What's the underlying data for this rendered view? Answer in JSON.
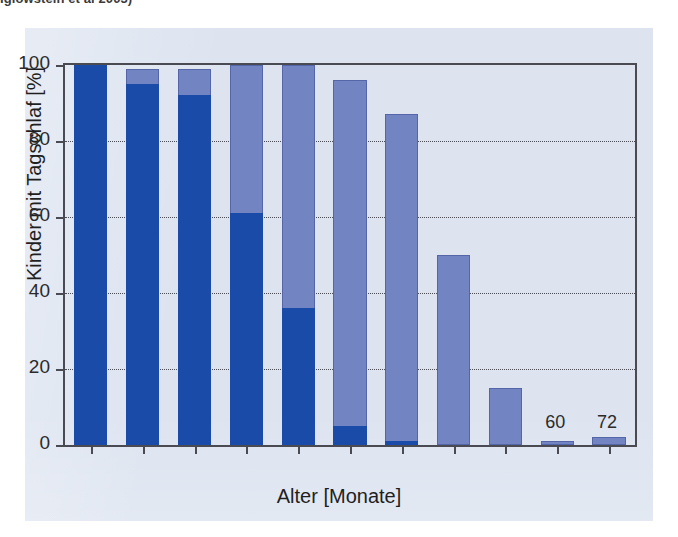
{
  "caption": {
    "text": "Iglowstein et al 2003)"
  },
  "chart_data": {
    "type": "bar",
    "stacked": true,
    "title": "",
    "xlabel": "Alter [Monate]",
    "ylabel": "Kinder mit Tagschlaf [%]",
    "categories": [
      "1",
      "3",
      "6",
      "9",
      "12",
      "18",
      "24",
      "36",
      "48",
      "60",
      "72"
    ],
    "ylim": [
      0,
      100
    ],
    "yticks": [
      0,
      20,
      40,
      60,
      80,
      100
    ],
    "ytick_labels": [
      "0",
      "20",
      "40",
      "60",
      "80",
      "100"
    ],
    "grid": true,
    "grid_axis": "y",
    "legend": "none",
    "series": [
      {
        "name": "dark-blue-segment",
        "color": "#1b4ba8",
        "values": [
          100,
          95,
          92,
          61,
          36,
          5,
          1,
          0,
          0,
          0,
          0
        ]
      },
      {
        "name": "light-blue-segment",
        "color": "#7384c3",
        "values": [
          0,
          4,
          7,
          39,
          64,
          91,
          86,
          50,
          15,
          1,
          2
        ]
      }
    ],
    "totals": [
      100,
      99,
      99,
      100,
      100,
      96,
      87,
      50,
      15,
      1,
      2
    ]
  },
  "colors": {
    "dark_blue": "#1b4ba8",
    "light_blue": "#7384c3",
    "panel_background": "#dde4f0",
    "axis": "#4a4a52",
    "page_background": "#ffffff"
  }
}
